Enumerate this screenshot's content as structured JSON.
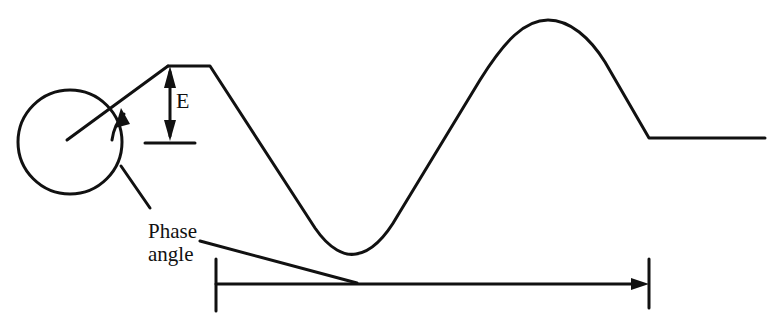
{
  "diagram": {
    "labels": {
      "amplitude": "E",
      "phase_line1": "Phase",
      "phase_line2": "angle"
    },
    "colors": {
      "stroke": "#111111",
      "background": "#ffffff"
    },
    "elements": [
      "rotating-vector-circle",
      "radius-vector",
      "phase-angle-arc-arrow",
      "amplitude-E-arrow",
      "waveform-trace",
      "cycle-span-arrow",
      "phase-angle-leader-lines"
    ]
  }
}
